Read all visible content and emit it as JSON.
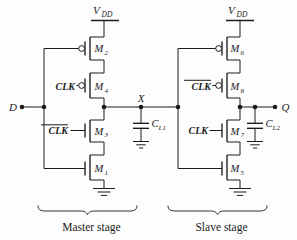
{
  "figure_type": "cmos-master-slave-flipflop-schematic",
  "colors": {
    "ink": "#1c1c1c",
    "background": "#fdfdfd"
  },
  "master": {
    "stage_label": "Master stage",
    "vdd_base": "V",
    "vdd_sub": "DD",
    "input_base": "D",
    "node_base": "X",
    "cap_base": "C",
    "cap_sub": "L1",
    "clk_label": "CLK",
    "clkbar_label": "CLK",
    "m2_base": "M",
    "m2_sub": "2",
    "m4_base": "M",
    "m4_sub": "4",
    "m3_base": "M",
    "m3_sub": "3",
    "m1_base": "M",
    "m1_sub": "1"
  },
  "slave": {
    "stage_label": "Slave stage",
    "vdd_base": "V",
    "vdd_sub": "DD",
    "node_base": "Q",
    "cap_base": "C",
    "cap_sub": "L2",
    "clk_label": "CLK",
    "clkbar_label": "CLK",
    "m6_base": "M",
    "m6_sub": "6",
    "m8_base": "M",
    "m8_sub": "8",
    "m7_base": "M",
    "m7_sub": "7",
    "m5_base": "M",
    "m5_sub": "5"
  }
}
